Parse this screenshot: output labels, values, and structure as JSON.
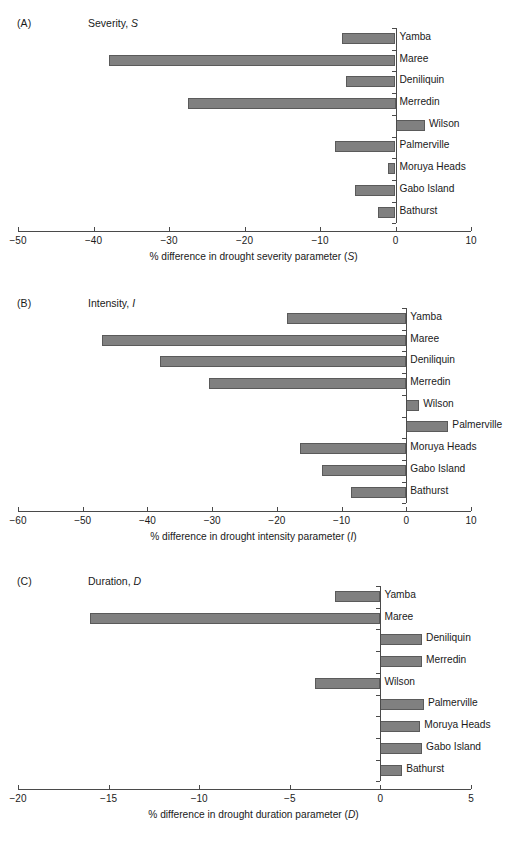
{
  "figure": {
    "categories": [
      "Yamba",
      "Maree",
      "Deniliquin",
      "Merredin",
      "Wilson",
      "Palmerville",
      "Moruya Heads",
      "Gabo Island",
      "Bathurst"
    ]
  },
  "panels": [
    {
      "tag": "(A)",
      "title_prefix": "Severity, ",
      "title_symbol": "S",
      "axis_title_prefix": "% difference in drought severity parameter (",
      "axis_title_symbol": "S",
      "axis_title_suffix": ")",
      "ticks": [
        "−50",
        "−40",
        "−30",
        "−20",
        "−10",
        "0",
        "10"
      ]
    },
    {
      "tag": "(B)",
      "title_prefix": "Intensity, ",
      "title_symbol": "I",
      "axis_title_prefix": "% difference in drought intensity parameter (",
      "axis_title_symbol": "I",
      "axis_title_suffix": ")",
      "ticks": [
        "−60",
        "−50",
        "−40",
        "−30",
        "−20",
        "−10",
        "0",
        "10"
      ]
    },
    {
      "tag": "(C)",
      "title_prefix": "Duration, ",
      "title_symbol": "D",
      "axis_title_prefix": "% difference in drought duration parameter (",
      "axis_title_symbol": "D",
      "axis_title_suffix": ")",
      "ticks": [
        "−20",
        "−15",
        "−10",
        "−5",
        "0",
        "5"
      ]
    }
  ],
  "chart_data": [
    {
      "type": "bar",
      "orientation": "horizontal",
      "title": "Severity, S",
      "panel": "(A)",
      "categories": [
        "Yamba",
        "Maree",
        "Deniliquin",
        "Merredin",
        "Wilson",
        "Palmerville",
        "Moruya Heads",
        "Gabo Island",
        "Bathurst"
      ],
      "values": [
        -7.1,
        -38.0,
        -6.5,
        -27.5,
        3.9,
        -8.0,
        -1.0,
        -5.3,
        -2.3
      ],
      "xlabel": "% difference in drought severity parameter (S)",
      "ylabel": "",
      "xlim": [
        -50,
        10
      ],
      "xticks": [
        -50,
        -40,
        -30,
        -20,
        -10,
        0,
        10
      ],
      "grid": false,
      "legend": "none",
      "bar_color": "#808080"
    },
    {
      "type": "bar",
      "orientation": "horizontal",
      "title": "Intensity, I",
      "panel": "(B)",
      "categories": [
        "Yamba",
        "Maree",
        "Deniliquin",
        "Merredin",
        "Wilson",
        "Palmerville",
        "Moruya Heads",
        "Gabo Island",
        "Bathurst"
      ],
      "values": [
        -18.5,
        -47.0,
        -38.0,
        -30.5,
        2.0,
        6.5,
        -16.5,
        -13.0,
        -8.5
      ],
      "xlabel": "% difference in drought intensity parameter (I)",
      "ylabel": "",
      "xlim": [
        -60,
        10
      ],
      "xticks": [
        -60,
        -50,
        -40,
        -30,
        -20,
        -10,
        0,
        10
      ],
      "grid": false,
      "legend": "none",
      "bar_color": "#808080"
    },
    {
      "type": "bar",
      "orientation": "horizontal",
      "title": "Duration, D",
      "panel": "(C)",
      "categories": [
        "Yamba",
        "Maree",
        "Deniliquin",
        "Merredin",
        "Wilson",
        "Palmerville",
        "Moruya Heads",
        "Gabo Island",
        "Bathurst"
      ],
      "values": [
        -2.5,
        -16.0,
        2.3,
        2.3,
        -3.6,
        2.4,
        2.2,
        2.3,
        1.2
      ],
      "xlabel": "% difference in drought duration parameter (D)",
      "ylabel": "",
      "xlim": [
        -20,
        5
      ],
      "xticks": [
        -20,
        -15,
        -10,
        -5,
        0,
        5
      ],
      "grid": false,
      "legend": "none",
      "bar_color": "#808080"
    }
  ]
}
